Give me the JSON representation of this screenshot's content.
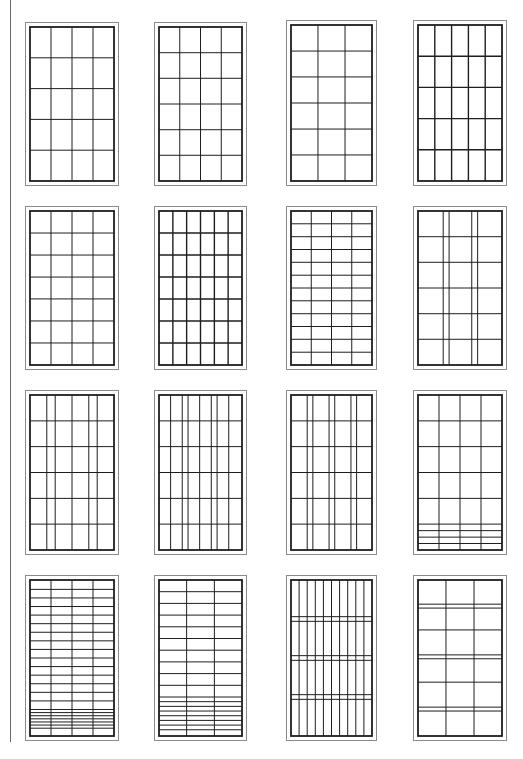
{
  "stroke_color": "#1e1e1e",
  "frame_color": "#8a8a8a",
  "rule_color": "#6a6a6a",
  "faint_mark": "",
  "panels": [
    {
      "id": "r1c1",
      "label": "4 columns x 5 rows",
      "x": 25,
      "y": 22,
      "w": 94,
      "h": 164,
      "cols": [
        0.25,
        0.5,
        0.75
      ],
      "rows": [
        0.2,
        0.4,
        0.6,
        0.8
      ]
    },
    {
      "id": "r1c2",
      "label": "4 columns x 6 rows",
      "x": 154,
      "y": 22,
      "w": 93,
      "h": 164,
      "cols": [
        0.25,
        0.5,
        0.75
      ],
      "rows": [
        0.167,
        0.333,
        0.5,
        0.667,
        0.833
      ]
    },
    {
      "id": "r1c3",
      "label": "3 columns x 6 rows",
      "x": 286,
      "y": 20,
      "w": 91,
      "h": 166,
      "cols": [
        0.333,
        0.667
      ],
      "rows": [
        0.167,
        0.333,
        0.5,
        0.667,
        0.833
      ]
    },
    {
      "id": "r1c4",
      "label": "5 columns x 5 rows (heavy)",
      "x": 413,
      "y": 20,
      "w": 94,
      "h": 166,
      "cols": [
        0.2,
        0.4,
        0.6,
        0.8
      ],
      "rows": [
        0.2,
        0.4,
        0.6,
        0.8
      ],
      "heavy": true
    },
    {
      "id": "r2c1",
      "label": "4 columns x 7 rows",
      "x": 25,
      "y": 206,
      "w": 94,
      "h": 164,
      "cols": [
        0.25,
        0.5,
        0.75
      ],
      "rows": [
        0.143,
        0.286,
        0.429,
        0.571,
        0.714,
        0.857
      ]
    },
    {
      "id": "r2c2",
      "label": "6 columns x 7 rows (heavy)",
      "x": 154,
      "y": 206,
      "w": 93,
      "h": 164,
      "cols": [
        0.167,
        0.333,
        0.5,
        0.667,
        0.833
      ],
      "rows": [
        0.143,
        0.286,
        0.429,
        0.571,
        0.714,
        0.857
      ],
      "heavy": true
    },
    {
      "id": "r2c3",
      "label": "4 columns x 12 rows",
      "x": 286,
      "y": 206,
      "w": 91,
      "h": 164,
      "cols": [
        0.25,
        0.5,
        0.75
      ],
      "rows": [
        0.083,
        0.167,
        0.25,
        0.333,
        0.417,
        0.5,
        0.583,
        0.667,
        0.75,
        0.833,
        0.917
      ]
    },
    {
      "id": "r2c4",
      "label": "paired mullions x 6 rows",
      "x": 413,
      "y": 206,
      "w": 94,
      "h": 164,
      "cols": [
        0.3,
        0.37,
        0.64,
        0.71
      ],
      "rows": [
        0.167,
        0.333,
        0.5,
        0.667,
        0.833
      ]
    },
    {
      "id": "r3c1",
      "label": "paired mullions x 6 rows",
      "x": 25,
      "y": 390,
      "w": 94,
      "h": 165,
      "cols": [
        0.2,
        0.3,
        0.5,
        0.7,
        0.8
      ],
      "rows": [
        0.167,
        0.333,
        0.5,
        0.667,
        0.833
      ]
    },
    {
      "id": "r3c2",
      "label": "8 columns x 6 rows",
      "x": 154,
      "y": 390,
      "w": 93,
      "h": 165,
      "cols": [
        0.14,
        0.28,
        0.35,
        0.49,
        0.63,
        0.7,
        0.84
      ],
      "rows": [
        0.167,
        0.333,
        0.5,
        0.667,
        0.833
      ]
    },
    {
      "id": "r3c3",
      "label": "three paired mullions x 6 rows",
      "x": 286,
      "y": 390,
      "w": 91,
      "h": 165,
      "cols": [
        0.2,
        0.27,
        0.47,
        0.54,
        0.74,
        0.81
      ],
      "rows": [
        0.167,
        0.333,
        0.5,
        0.667,
        0.833
      ]
    },
    {
      "id": "r3c4",
      "label": "4 columns x 5 rows with banded base",
      "x": 413,
      "y": 390,
      "w": 94,
      "h": 165,
      "cols": [
        0.25,
        0.5,
        0.75
      ],
      "rows": [
        0.167,
        0.333,
        0.5,
        0.667,
        0.833,
        0.875,
        0.917,
        0.958
      ]
    },
    {
      "id": "r4c1",
      "label": "4 columns x 16 rows with fine base bands",
      "x": 25,
      "y": 575,
      "w": 94,
      "h": 166,
      "cols": [
        0.25,
        0.5,
        0.75
      ],
      "rows": [
        0.06,
        0.115,
        0.17,
        0.225,
        0.28,
        0.335,
        0.39,
        0.445,
        0.5,
        0.555,
        0.61,
        0.665,
        0.72,
        0.775,
        0.83,
        0.85,
        0.87,
        0.89,
        0.91,
        0.93,
        0.95
      ]
    },
    {
      "id": "r4c2",
      "label": "3 columns x 12 rows with fine base bands",
      "x": 154,
      "y": 575,
      "w": 93,
      "h": 166,
      "cols": [
        0.333,
        0.667
      ],
      "rows": [
        0.075,
        0.15,
        0.225,
        0.3,
        0.375,
        0.45,
        0.525,
        0.6,
        0.675,
        0.75,
        0.78,
        0.81,
        0.84,
        0.87,
        0.9,
        0.93,
        0.96
      ]
    },
    {
      "id": "r4c3",
      "label": "10 vertical bars with 3 double transoms",
      "x": 286,
      "y": 575,
      "w": 91,
      "h": 166,
      "cols": [
        0.1,
        0.2,
        0.3,
        0.4,
        0.5,
        0.6,
        0.7,
        0.8,
        0.9
      ],
      "rows": [
        0.235,
        0.265,
        0.485,
        0.515,
        0.735,
        0.765
      ]
    },
    {
      "id": "r4c4",
      "label": "3 columns with double and single transoms",
      "x": 413,
      "y": 575,
      "w": 94,
      "h": 166,
      "cols": [
        0.333,
        0.667
      ],
      "rows": [
        0.155,
        0.18,
        0.32,
        0.48,
        0.505,
        0.655,
        0.815,
        0.84
      ]
    }
  ]
}
